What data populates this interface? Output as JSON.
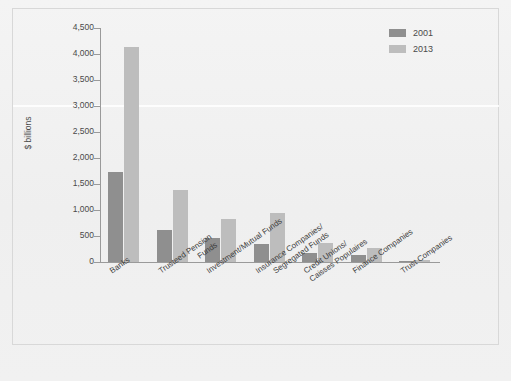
{
  "chart_data": {
    "type": "bar",
    "title": "",
    "subtitle": "",
    "xlabel": "",
    "ylabel": "$ billions",
    "ylim": [
      0,
      4500
    ],
    "ytick_step": 500,
    "grid": false,
    "legend_position": "top-right",
    "categories": [
      "Banks",
      "Trusteed Pension Funds",
      "Investment/Mutual Funds",
      "Insurance Companies/ Segregated Funds",
      "Credit Unions/ Caisses Populaires",
      "Finance Companies",
      "Trust Companies"
    ],
    "category_lines": [
      [
        "Banks",
        ""
      ],
      [
        "Trusteed Pension",
        "Funds"
      ],
      [
        "Investment/Mutual Funds",
        ""
      ],
      [
        "Insurance Companies/",
        "Segregated Funds"
      ],
      [
        "Credit Unions/",
        "Caisses Populaires"
      ],
      [
        "Finance Companies",
        ""
      ],
      [
        "Trust Companies",
        ""
      ]
    ],
    "ytick_labels": [
      "0",
      "500",
      "1,000",
      "1,500",
      "2,000",
      "2,500",
      "3,000",
      "3,500",
      "4,000",
      "4,500"
    ],
    "ytick_values": [
      0,
      500,
      1000,
      1500,
      2000,
      2500,
      3000,
      3500,
      4000,
      4500
    ],
    "series": [
      {
        "name": "2001",
        "color": "#8f8f8f",
        "values": [
          1740,
          620,
          470,
          340,
          180,
          140,
          20
        ]
      },
      {
        "name": "2013",
        "color": "#bdbdbd",
        "values": [
          4130,
          1380,
          830,
          940,
          360,
          260,
          30
        ]
      }
    ]
  },
  "legend": {
    "items": [
      {
        "label": "2001",
        "color": "#8f8f8f"
      },
      {
        "label": "2013",
        "color": "#bdbdbd"
      }
    ]
  },
  "axis": {
    "y_title": "$ billions"
  }
}
